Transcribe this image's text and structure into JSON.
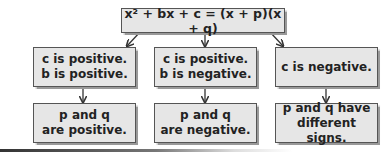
{
  "diagram": {
    "top": {
      "text": "x² + bx + c = (x + p)(x + q)"
    },
    "cases": [
      {
        "condition_line1": "c is positive.",
        "condition_line2": "b is positive.",
        "result_line1": "p and q",
        "result_line2": "are positive."
      },
      {
        "condition_line1": "c is positive.",
        "condition_line2": "b is negative.",
        "result_line1": "p and q",
        "result_line2": "are negative."
      },
      {
        "condition_line1": "c is negative.",
        "condition_line2": "",
        "result_line1": "p and q have",
        "result_line2": "different signs."
      }
    ]
  },
  "colors": {
    "box_fill": "#e6e6e6",
    "box_border": "#555555",
    "arrow": "#333333"
  }
}
